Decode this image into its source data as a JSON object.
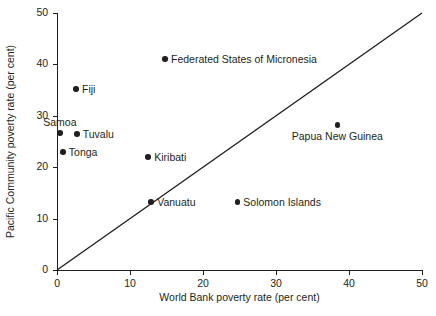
{
  "chart_data": {
    "type": "scatter",
    "title": "",
    "xlabel": "World Bank poverty rate (per cent)",
    "ylabel": "Pacific Community poverty rate (per cent)",
    "xlim": [
      0,
      50
    ],
    "ylim": [
      0,
      50
    ],
    "xticks": [
      0,
      10,
      20,
      30,
      40,
      50
    ],
    "yticks": [
      0,
      10,
      20,
      30,
      40,
      50
    ],
    "xtick_labels": [
      "0",
      "10",
      "20",
      "30",
      "40",
      "50"
    ],
    "ytick_labels": [
      "0",
      "10",
      "20",
      "30",
      "40",
      "50"
    ],
    "grid": false,
    "legend": "none",
    "reference_line": {
      "name": "45-degree parity line",
      "from": [
        0,
        0
      ],
      "to": [
        50,
        50
      ],
      "color": "#231f20"
    },
    "point_color": "#231f20",
    "points": [
      {
        "label": "Samoa",
        "x": 0.4,
        "y": 26.7,
        "label_pos": "above"
      },
      {
        "label": "Tuvalu",
        "x": 2.7,
        "y": 26.5,
        "label_pos": "right"
      },
      {
        "label": "Tonga",
        "x": 0.8,
        "y": 23.0,
        "label_pos": "right"
      },
      {
        "label": "Fiji",
        "x": 2.6,
        "y": 35.2,
        "label_pos": "right"
      },
      {
        "label": "Federated States of Micronesia",
        "x": 14.8,
        "y": 41.1,
        "label_pos": "right"
      },
      {
        "label": "Kiribati",
        "x": 12.5,
        "y": 22.0,
        "label_pos": "right"
      },
      {
        "label": "Vanuatu",
        "x": 12.9,
        "y": 13.2,
        "label_pos": "right"
      },
      {
        "label": "Solomon Islands",
        "x": 24.7,
        "y": 13.2,
        "label_pos": "right"
      },
      {
        "label": "Papua New Guinea",
        "x": 38.4,
        "y": 28.2,
        "label_pos": "below"
      }
    ]
  }
}
